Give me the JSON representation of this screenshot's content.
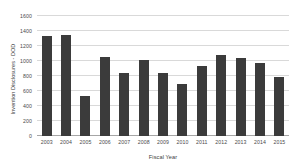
{
  "chart_data": {
    "type": "bar",
    "title": "",
    "xlabel": "Fiscal Year",
    "ylabel": "Invention Disclosures - DOD",
    "categories": [
      "2003",
      "2004",
      "2005",
      "2006",
      "2007",
      "2008",
      "2009",
      "2010",
      "2011",
      "2012",
      "2013",
      "2014",
      "2015"
    ],
    "values": [
      1333,
      1347,
      540,
      1055,
      840,
      1020,
      835,
      700,
      935,
      1080,
      1040,
      970,
      790
    ],
    "ylim": [
      0,
      1600
    ],
    "ytick_labels": [
      "0",
      "200",
      "400",
      "600",
      "800",
      "1000",
      "1200",
      "1400",
      "1600"
    ],
    "ytick_values": [
      0,
      200,
      400,
      600,
      800,
      1000,
      1200,
      1400,
      1600
    ],
    "grid": "horizontal",
    "legend": "none",
    "bar_color": "#3b3b3b",
    "gridline_color": "#d9d9d9",
    "axis_color": "#a6a6a6",
    "background": "#ffffff"
  }
}
